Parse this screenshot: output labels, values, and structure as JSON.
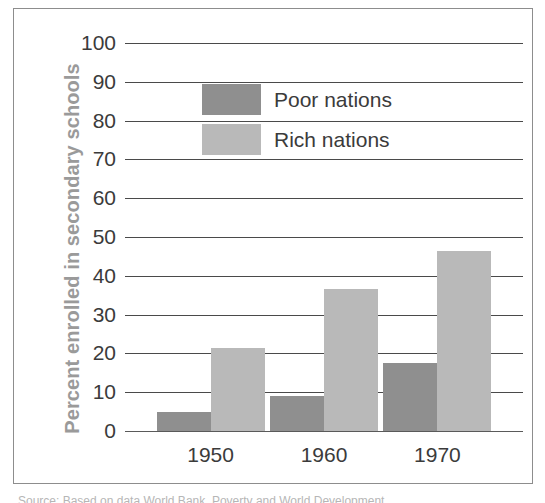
{
  "chart_data": {
    "type": "bar",
    "title": "",
    "xlabel": "",
    "ylabel": "Percent enrolled in secondary schools",
    "categories": [
      "1950",
      "1960",
      "1970"
    ],
    "series": [
      {
        "name": "Poor nations",
        "color": "#8f8f8f",
        "values": [
          5,
          9,
          17.5
        ]
      },
      {
        "name": "Rich nations",
        "color": "#b9b9b9",
        "values": [
          21.5,
          36.5,
          46.5
        ]
      }
    ],
    "ylim": [
      0,
      100
    ],
    "yticks": [
      0,
      10,
      20,
      30,
      40,
      50,
      60,
      70,
      80,
      90,
      100
    ],
    "ytick_labels": [
      "0",
      "10",
      "20",
      "30",
      "40",
      "50",
      "60",
      "70",
      "80",
      "90",
      "100"
    ],
    "grid": true,
    "legend_position": "upper-left-inside"
  },
  "legend": {
    "items": [
      {
        "label": "Poor nations",
        "color": "#8f8f8f"
      },
      {
        "label": "Rich nations",
        "color": "#b9b9b9"
      }
    ]
  },
  "caption": {
    "text": "Source: Based on data  World Bank, Poverty and World Development"
  }
}
